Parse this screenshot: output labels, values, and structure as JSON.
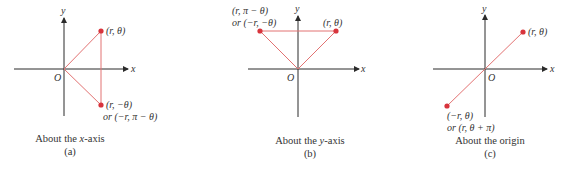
{
  "colors": {
    "axis": "#2b2b2b",
    "segment": "#e27272",
    "point": "#d8343c",
    "text": "#333333"
  },
  "panels": [
    {
      "id": "a",
      "axes": {
        "x_label": "x",
        "y_label": "y",
        "origin_label": "O"
      },
      "points": [
        {
          "label": "(r, θ)"
        },
        {
          "label_line1": "(r, −θ)",
          "label_line2": "or (−r, π − θ)"
        }
      ],
      "caption": {
        "title_prefix": "About the ",
        "title_var": "x",
        "title_suffix": "-axis",
        "letter": "(a)"
      }
    },
    {
      "id": "b",
      "axes": {
        "x_label": "x",
        "y_label": "y",
        "origin_label": "O"
      },
      "points": [
        {
          "label_line1": "(r, π − θ)",
          "label_line2": "or (−r, −θ)"
        },
        {
          "label": "(r, θ)"
        }
      ],
      "caption": {
        "title_prefix": "About the ",
        "title_var": "y",
        "title_suffix": "-axis",
        "letter": "(b)"
      }
    },
    {
      "id": "c",
      "axes": {
        "x_label": "x",
        "y_label": "y",
        "origin_label": "O"
      },
      "points": [
        {
          "label": "(r, θ)"
        },
        {
          "label_line1": "(−r, θ)",
          "label_line2": "or (r, θ + π)"
        }
      ],
      "caption": {
        "title": "About the origin",
        "letter": "(c)"
      }
    }
  ]
}
